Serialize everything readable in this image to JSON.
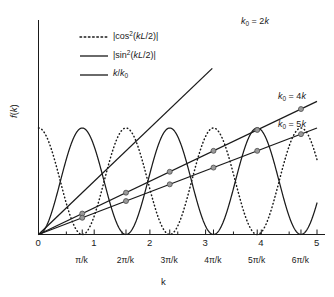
{
  "chart_data": {
    "type": "line",
    "title": "",
    "xlabel": "k",
    "ylabel": "f(k)",
    "xlim": [
      0,
      5
    ],
    "ylim": [
      0,
      1.55
    ],
    "grid": false,
    "legend_position": "upper-left-inside",
    "x_tick_labels_numeric": [
      "0",
      "1",
      "2",
      "3",
      "4",
      "5"
    ],
    "x_tick_values_numeric": [
      0,
      1,
      2,
      3,
      4,
      5
    ],
    "x_tick_labels_pi": [
      "π/k",
      "2π/k",
      "3π/k",
      "4π/k",
      "5π/k",
      "6π/k"
    ],
    "x_tick_values_pi": [
      0.7854,
      1.5708,
      2.3562,
      3.1416,
      3.927,
      4.7124
    ],
    "y_tick_labels": [],
    "series": [
      {
        "name": "|cos²(kL/2)|",
        "style": "dotted",
        "color": "#1a1a1a",
        "formula": "abs(cos(pi*x)^2)",
        "period": 1.5708,
        "amplitude": 1.0,
        "phase": "max at x=0",
        "markers": false
      },
      {
        "name": "|sin²(kL/2)|",
        "style": "solid",
        "color": "#1a1a1a",
        "formula": "abs(sin(pi*x)^2)",
        "period": 1.5708,
        "amplitude": 1.0,
        "phase": "zero at x=0",
        "markers": false
      },
      {
        "name": "k/k₀",
        "style": "solid",
        "color": "#1a1a1a",
        "label": "k₀ = 2k",
        "slope": 0.5,
        "x_range": [
          0,
          3.12
        ],
        "markers": false
      },
      {
        "name": "k/k₀",
        "style": "solid",
        "color": "#1a1a1a",
        "label": "k₀ = 4k",
        "slope": 0.25,
        "x_range": [
          0,
          5
        ],
        "markers": true,
        "marker_x": [
          0.7854,
          1.5708,
          2.3562,
          3.1416,
          3.927,
          4.7124
        ]
      },
      {
        "name": "k/k₀",
        "style": "solid",
        "color": "#1a1a1a",
        "label": "k₀ = 5k",
        "slope": 0.2,
        "x_range": [
          0,
          5
        ],
        "markers": true,
        "marker_x": [
          0.7854,
          1.5708,
          2.3562,
          3.1416,
          3.927,
          4.7124
        ]
      }
    ],
    "marker_style": {
      "shape": "circle",
      "fill": "#9a9a9a",
      "edge": "#4d4d4d",
      "size": 4
    }
  },
  "legend": {
    "entries": [
      {
        "label_html": "|cos<sup>2</sup>(<i>kL</i>/2)|",
        "style": "dotted"
      },
      {
        "label_html": "|sin<sup>2</sup>(<i>kL</i>/2)|",
        "style": "solid"
      },
      {
        "label_html": "<i>k</i>/<i>k</i><sub>0</sub>",
        "style": "solid"
      }
    ]
  },
  "annotations": {
    "line_2k": "k₀ = 2k",
    "line_4k": "k₀ = 4k",
    "line_5k": "k₀ = 5k"
  },
  "axes": {
    "x_title": "k",
    "y_title": "f(k)"
  }
}
